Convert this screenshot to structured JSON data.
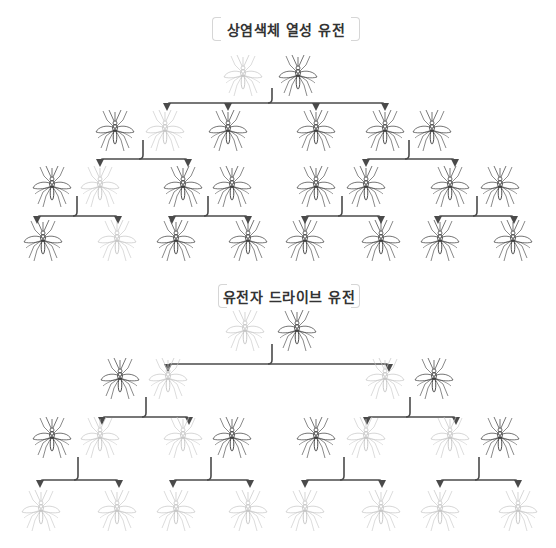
{
  "sections": [
    {
      "title": "상염색체 열성 유전",
      "title_box": {
        "x": 212,
        "y": 17,
        "w": 148
      },
      "generations": [
        {
          "y": 75,
          "mosquitoes": [
            {
              "x": 243,
              "carrier": false
            },
            {
              "x": 298,
              "carrier": true
            }
          ]
        },
        {
          "y": 130,
          "mosquitoes": [
            {
              "x": 115,
              "carrier": true
            },
            {
              "x": 165,
              "carrier": false
            },
            {
              "x": 228,
              "carrier": true
            },
            {
              "x": 316,
              "carrier": true
            },
            {
              "x": 385,
              "carrier": true
            },
            {
              "x": 432,
              "carrier": true
            }
          ]
        },
        {
          "y": 186,
          "mosquitoes": [
            {
              "x": 52,
              "carrier": true
            },
            {
              "x": 100,
              "carrier": false
            },
            {
              "x": 183,
              "carrier": true
            },
            {
              "x": 232,
              "carrier": true
            },
            {
              "x": 316,
              "carrier": true
            },
            {
              "x": 366,
              "carrier": true
            },
            {
              "x": 450,
              "carrier": true
            },
            {
              "x": 500,
              "carrier": true
            }
          ]
        },
        {
          "y": 240,
          "mosquitoes": [
            {
              "x": 43,
              "carrier": true
            },
            {
              "x": 117,
              "carrier": false
            },
            {
              "x": 176,
              "carrier": true
            },
            {
              "x": 248,
              "carrier": true
            },
            {
              "x": 305,
              "carrier": true
            },
            {
              "x": 381,
              "carrier": true
            },
            {
              "x": 440,
              "carrier": true
            },
            {
              "x": 513,
              "carrier": true
            }
          ]
        }
      ],
      "branches": [
        {
          "stem_x": 272,
          "stem_top": 88,
          "bar_y": 103,
          "targets": [
            167,
            228,
            316,
            385
          ]
        },
        {
          "stem_x": 143,
          "stem_top": 140,
          "bar_y": 159,
          "targets": [
            100,
            188
          ]
        },
        {
          "stem_x": 409,
          "stem_top": 140,
          "bar_y": 159,
          "targets": [
            366,
            455
          ]
        },
        {
          "stem_x": 77,
          "stem_top": 196,
          "bar_y": 216,
          "targets": [
            37,
            118
          ]
        },
        {
          "stem_x": 208,
          "stem_top": 196,
          "bar_y": 216,
          "targets": [
            172,
            248
          ]
        },
        {
          "stem_x": 342,
          "stem_top": 196,
          "bar_y": 216,
          "targets": [
            305,
            381
          ]
        },
        {
          "stem_x": 477,
          "stem_top": 196,
          "bar_y": 216,
          "targets": [
            438,
            514
          ]
        }
      ]
    },
    {
      "title": "유전자 드라이브 유전",
      "title_box": {
        "x": 218,
        "y": 284,
        "w": 142
      },
      "generations": [
        {
          "y": 330,
          "mosquitoes": [
            {
              "x": 245,
              "carrier": false
            },
            {
              "x": 297,
              "carrier": true
            }
          ]
        },
        {
          "y": 378,
          "mosquitoes": [
            {
              "x": 120,
              "carrier": true
            },
            {
              "x": 168,
              "carrier": false
            },
            {
              "x": 385,
              "carrier": false
            },
            {
              "x": 434,
              "carrier": true
            }
          ]
        },
        {
          "y": 437,
          "mosquitoes": [
            {
              "x": 52,
              "carrier": true
            },
            {
              "x": 100,
              "carrier": false
            },
            {
              "x": 183,
              "carrier": false
            },
            {
              "x": 232,
              "carrier": true
            },
            {
              "x": 316,
              "carrier": true
            },
            {
              "x": 366,
              "carrier": false
            },
            {
              "x": 450,
              "carrier": false
            },
            {
              "x": 500,
              "carrier": true
            }
          ]
        },
        {
          "y": 510,
          "mosquitoes": [
            {
              "x": 41,
              "carrier": false
            },
            {
              "x": 117,
              "carrier": false
            },
            {
              "x": 176,
              "carrier": false
            },
            {
              "x": 248,
              "carrier": false
            },
            {
              "x": 305,
              "carrier": false
            },
            {
              "x": 381,
              "carrier": false
            },
            {
              "x": 440,
              "carrier": false
            },
            {
              "x": 518,
              "carrier": false
            }
          ]
        }
      ],
      "branches": [
        {
          "stem_x": 272,
          "stem_top": 344,
          "bar_y": 364,
          "targets": [
            168,
            389
          ]
        },
        {
          "stem_x": 146,
          "stem_top": 397,
          "bar_y": 417,
          "targets": [
            102,
            189
          ]
        },
        {
          "stem_x": 410,
          "stem_top": 397,
          "bar_y": 417,
          "targets": [
            367,
            456
          ]
        },
        {
          "stem_x": 78,
          "stem_top": 457,
          "bar_y": 480,
          "targets": [
            40,
            119
          ]
        },
        {
          "stem_x": 211,
          "stem_top": 457,
          "bar_y": 480,
          "targets": [
            173,
            250
          ]
        },
        {
          "stem_x": 344,
          "stem_top": 457,
          "bar_y": 480,
          "targets": [
            305,
            382
          ]
        },
        {
          "stem_x": 479,
          "stem_top": 457,
          "bar_y": 480,
          "targets": [
            440,
            518
          ]
        }
      ]
    }
  ],
  "colors": {
    "carrier": "#3a3a3a",
    "non_carrier": "#c4c4c4",
    "branch": "#4a4a4a",
    "title_text": "#333333",
    "bracket": "#d6d6d6"
  }
}
